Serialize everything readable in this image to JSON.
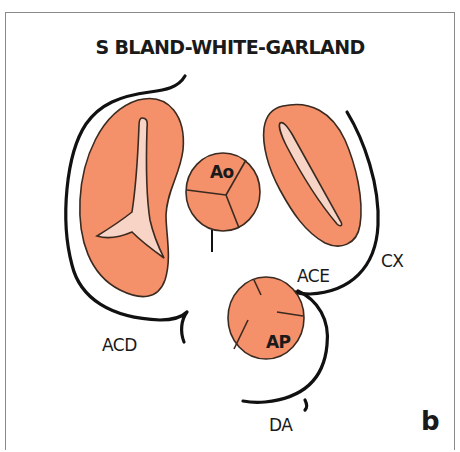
{
  "title": "S BLAND-WHITE-GARLAND",
  "panel_letter": "b",
  "colors": {
    "tissue": "#f4906a",
    "lumen": "#f7d4c6",
    "vessel": "#111111",
    "outline": "#3a2a20",
    "frame": "#8a8a8a"
  },
  "structures": {
    "aorta": "Ao",
    "pulmonary_artery": "AP"
  },
  "vessel_labels": {
    "right_coronary": "ACD",
    "left_coronary": "ACE",
    "circumflex": "CX",
    "anterior_descending": "DA"
  }
}
